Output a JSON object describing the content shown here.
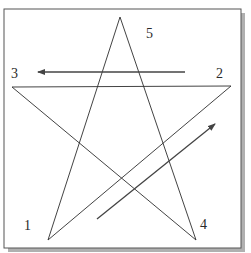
{
  "diagram": {
    "title": "",
    "colors": {
      "frame": "#555555",
      "shadow": "#b0b0b0",
      "lines": "#2e2e2e",
      "arrows": "#444444",
      "labels": "#2a2a2a",
      "background": "#ffffff"
    },
    "vertices": [
      {
        "id": "1",
        "label": "1",
        "x": 48,
        "y": 240
      },
      {
        "id": "2",
        "label": "2",
        "x": 231,
        "y": 86
      },
      {
        "id": "3",
        "label": "3",
        "x": 12,
        "y": 87
      },
      {
        "id": "4",
        "label": "4",
        "x": 196,
        "y": 240
      },
      {
        "id": "5",
        "label": "5",
        "x": 120,
        "y": 17
      }
    ],
    "edges": [
      {
        "from": "1",
        "to": "2"
      },
      {
        "from": "2",
        "to": "3"
      },
      {
        "from": "3",
        "to": "4"
      },
      {
        "from": "4",
        "to": "5"
      },
      {
        "from": "5",
        "to": "1"
      }
    ],
    "arrows": [
      {
        "name": "arrow-2-to-3",
        "x1": 185,
        "y1": 72,
        "x2": 38,
        "y2": 72
      },
      {
        "name": "arrow-1-toward-2",
        "x1": 97,
        "y1": 219,
        "x2": 215,
        "y2": 124
      }
    ],
    "labels": [
      {
        "text": "1",
        "x": 24,
        "y": 230
      },
      {
        "text": "2",
        "x": 216,
        "y": 78
      },
      {
        "text": "3",
        "x": 11,
        "y": 78
      },
      {
        "text": "4",
        "x": 200,
        "y": 229
      },
      {
        "text": "5",
        "x": 146,
        "y": 38
      }
    ]
  }
}
